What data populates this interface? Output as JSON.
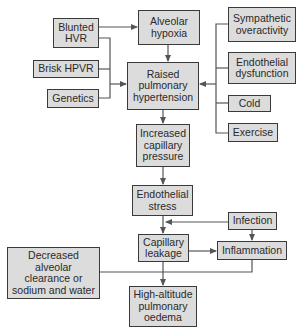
{
  "diagram": {
    "colors": {
      "box_fill": "#dcdcdc",
      "box_border": "#3a3a3a",
      "line": "#555555",
      "text": "#2a2a2a"
    },
    "nodes": {
      "blunted_hvr": "Blunted\nHVR",
      "alveolar_hypoxia": "Alveolar\nhypoxia",
      "brisk_hpvr": "Brisk HPVR",
      "genetics": "Genetics",
      "raised_pulm_htn": "Raised\npulmonary\nhypertension",
      "sympathetic": "Sympathetic\noveractivity",
      "endothelial_dysfunction": "Endothelial\ndysfunction",
      "cold": "Cold",
      "exercise": "Exercise",
      "increased_cap_pressure": "Increased\ncapillary\npressure",
      "endothelial_stress": "Endothelial\nstress",
      "infection": "Infection",
      "capillary_leakage": "Capillary\nleakage",
      "inflammation": "Inflammation",
      "decreased_clearance": "Decreased\nalveolar\nclearance or\nsodium and water",
      "hape": "High-altitude\npulmonary\noedema"
    },
    "edges": [
      [
        "blunted_hvr",
        "alveolar_hypoxia"
      ],
      [
        "blunted_hvr",
        "raised_pulm_htn"
      ],
      [
        "brisk_hpvr",
        "raised_pulm_htn"
      ],
      [
        "genetics",
        "raised_pulm_htn"
      ],
      [
        "alveolar_hypoxia",
        "raised_pulm_htn"
      ],
      [
        "sympathetic",
        "raised_pulm_htn"
      ],
      [
        "endothelial_dysfunction",
        "raised_pulm_htn"
      ],
      [
        "cold",
        "raised_pulm_htn"
      ],
      [
        "exercise",
        "raised_pulm_htn"
      ],
      [
        "raised_pulm_htn",
        "increased_cap_pressure"
      ],
      [
        "increased_cap_pressure",
        "endothelial_stress"
      ],
      [
        "endothelial_stress",
        "capillary_leakage"
      ],
      [
        "infection",
        "capillary_leakage"
      ],
      [
        "infection",
        "inflammation"
      ],
      [
        "capillary_leakage",
        "inflammation"
      ],
      [
        "capillary_leakage",
        "hape"
      ],
      [
        "inflammation",
        "hape"
      ],
      [
        "decreased_clearance",
        "hape"
      ]
    ]
  }
}
